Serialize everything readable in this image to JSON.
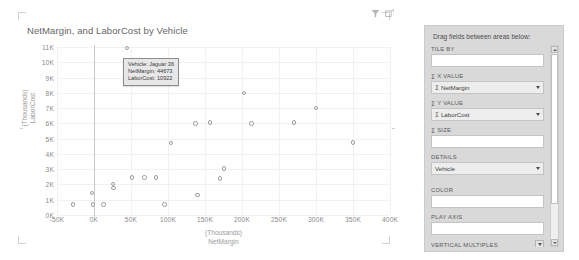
{
  "header": {
    "icons": [
      {
        "name": "filter-icon",
        "glyph": "funnel"
      },
      {
        "name": "focus-mode-icon",
        "glyph": "focus"
      }
    ]
  },
  "chart_card": {
    "title": "NetMargin, and LaborCost by Vehicle"
  },
  "tooltip": {
    "visible": true,
    "lines": [
      "Vehicle: Jaguar 36",
      "NetMargin: 44673",
      "LaborCost: 10922"
    ],
    "line1": "Vehicle: Jaguar 36",
    "line2": "NetMargin: 44673",
    "line3": "LaborCost: 10922"
  },
  "chart_data": {
    "type": "scatter",
    "title": "NetMargin, and LaborCost by Vehicle",
    "xlabel": "NetMargin",
    "xunit": "(Thousands)",
    "ylabel": "LaborCost",
    "yunit": "(Thousands)",
    "xlim": [
      -50000,
      400000
    ],
    "ylim": [
      0,
      11000
    ],
    "xticks": [
      "-50K",
      "0K",
      "50K",
      "100K",
      "150K",
      "200K",
      "250K",
      "300K",
      "350K",
      "400K"
    ],
    "xtick_values": [
      -50000,
      0,
      50000,
      100000,
      150000,
      200000,
      250000,
      300000,
      350000,
      400000
    ],
    "yticks": [
      "0K",
      "1K",
      "2K",
      "3K",
      "4K",
      "5K",
      "6K",
      "7K",
      "8K",
      "9K",
      "10K",
      "11K"
    ],
    "ytick_values": [
      0,
      1000,
      2000,
      3000,
      4000,
      5000,
      6000,
      7000,
      8000,
      9000,
      10000,
      11000
    ],
    "grid": true,
    "legend": "none",
    "marker_color": "#9aa0a6",
    "series": [
      {
        "name": "Vehicle",
        "points": [
          {
            "label": "Jaguar 36",
            "x": 44673,
            "y": 10922
          },
          {
            "label": "",
            "x": -28000,
            "y": 700
          },
          {
            "label": "",
            "x": -2500,
            "y": 1450
          },
          {
            "label": "",
            "x": -1500,
            "y": 700
          },
          {
            "label": "",
            "x": 13000,
            "y": 700
          },
          {
            "label": "",
            "x": 26000,
            "y": 2050
          },
          {
            "label": "",
            "x": 26500,
            "y": 1750
          },
          {
            "label": "",
            "x": 51000,
            "y": 2450
          },
          {
            "label": "",
            "x": 68000,
            "y": 2450
          },
          {
            "label": "",
            "x": 84000,
            "y": 2450
          },
          {
            "label": "",
            "x": 95000,
            "y": 700
          },
          {
            "label": "",
            "x": 104000,
            "y": 4700
          },
          {
            "label": "",
            "x": 137000,
            "y": 6000
          },
          {
            "label": "",
            "x": 140000,
            "y": 1300
          },
          {
            "label": "",
            "x": 157000,
            "y": 6050
          },
          {
            "label": "",
            "x": 170000,
            "y": 2400
          },
          {
            "label": "",
            "x": 176000,
            "y": 3050
          },
          {
            "label": "",
            "x": 203000,
            "y": 8000
          },
          {
            "label": "",
            "x": 213000,
            "y": 6000
          },
          {
            "label": "",
            "x": 270000,
            "y": 6050
          },
          {
            "label": "",
            "x": 300000,
            "y": 7000
          },
          {
            "label": "",
            "x": 350000,
            "y": 4750
          }
        ]
      }
    ]
  },
  "panel": {
    "title": "Drag fields between areas below:",
    "wells": [
      {
        "name": "tile-by",
        "label": "TILE BY",
        "sigma": false,
        "value": "",
        "has_value": false
      },
      {
        "name": "x-value",
        "label": "X VALUE",
        "sigma": true,
        "value": "NetMargin",
        "has_value": true,
        "value_sigma": true
      },
      {
        "name": "y-value",
        "label": "Y VALUE",
        "sigma": true,
        "value": "LaborCost",
        "has_value": true,
        "value_sigma": true
      },
      {
        "name": "size",
        "label": "SIZE",
        "sigma": true,
        "value": "",
        "has_value": false
      },
      {
        "name": "details",
        "label": "DETAILS",
        "sigma": false,
        "value": "Vehicle",
        "has_value": true,
        "value_sigma": false
      },
      {
        "name": "color",
        "label": "COLOR",
        "sigma": false,
        "value": "",
        "has_value": false
      },
      {
        "name": "play-axis",
        "label": "PLAY AXIS",
        "sigma": false,
        "value": "",
        "has_value": false
      }
    ],
    "vertical_multiples": {
      "label": "VERTICAL MULTIPLES"
    },
    "sigma_glyph": "Σ"
  }
}
